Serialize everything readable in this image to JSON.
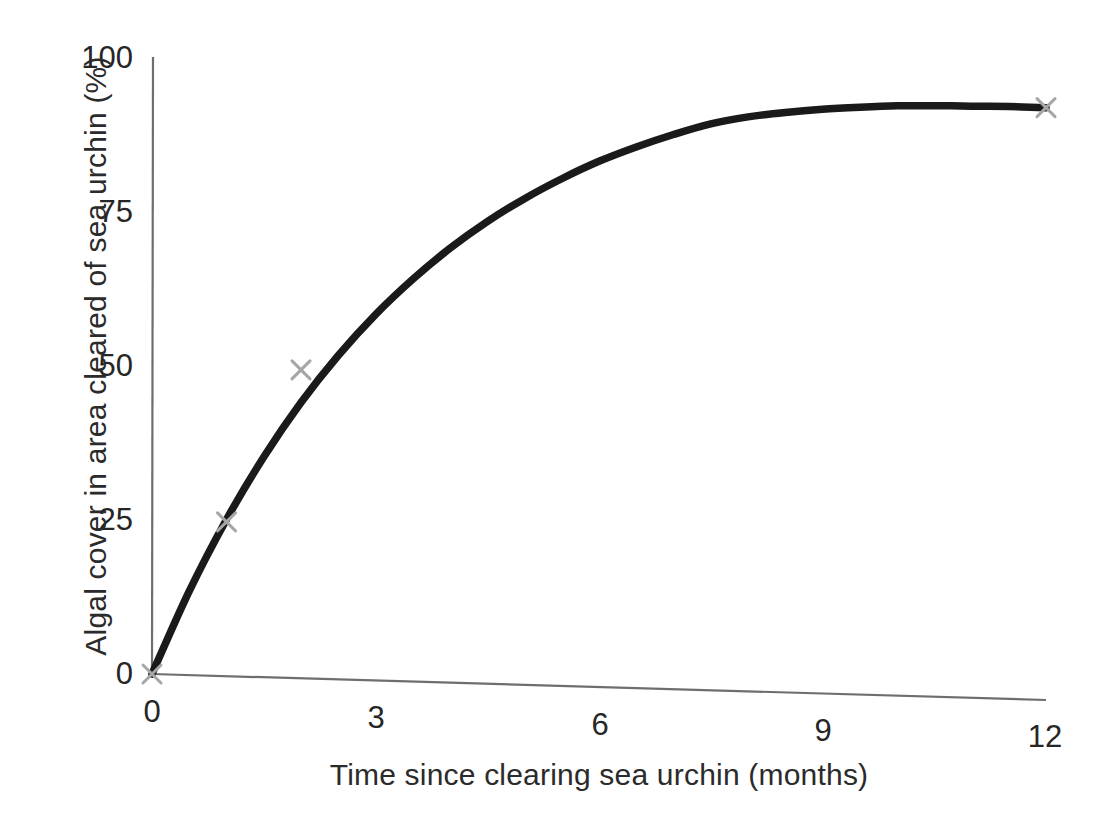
{
  "chart_data": {
    "type": "line",
    "title": "",
    "subtitle": "",
    "xlabel": "Time since clearing sea urchin (months)",
    "ylabel": "Algal cover in area cleared of sea urchin (%)",
    "xlim": [
      0,
      12
    ],
    "ylim": [
      0,
      100
    ],
    "xticks": [
      "0",
      "3",
      "6",
      "9",
      "12"
    ],
    "xtick_values": [
      0,
      3,
      6,
      9,
      12
    ],
    "yticks": [
      "0",
      "25",
      "50",
      "75",
      "100"
    ],
    "ytick_values": [
      0,
      25,
      50,
      75,
      100
    ],
    "grid": false,
    "legend": "none",
    "series": [
      {
        "name": "Algal cover",
        "style": "smooth-curve",
        "color": "#1a1a1a",
        "x": [
          0,
          0.5,
          1,
          1.5,
          2,
          2.5,
          3,
          3.5,
          4,
          4.5,
          5,
          5.5,
          6,
          6.5,
          7,
          7.5,
          8,
          8.5,
          9,
          9.5,
          10,
          10.5,
          11,
          11.5,
          12
        ],
        "values": [
          0,
          13.6,
          25.4,
          35.7,
          44.7,
          52.5,
          59.3,
          65.2,
          70.4,
          74.9,
          78.8,
          82.2,
          85.2,
          87.7,
          89.9,
          91.8,
          93.1,
          94.0,
          94.7,
          95.2,
          95.6,
          95.8,
          95.9,
          96.0,
          96.0
        ]
      },
      {
        "name": "Data points",
        "style": "x-markers",
        "color": "#a6a6a6",
        "x": [
          0,
          1,
          2,
          12
        ],
        "values": [
          0,
          25,
          50,
          96
        ]
      }
    ],
    "annotations": []
  },
  "axes": {
    "y_title": "Algal cover in area cleared of sea urchin (%)",
    "x_title": "Time since clearing sea urchin (months)",
    "axis_color": "#6e6e6e"
  },
  "colors": {
    "background": "#ffffff",
    "curve": "#1a1a1a",
    "marker": "#a6a6a6",
    "axis": "#6e6e6e",
    "text": "#262626"
  }
}
